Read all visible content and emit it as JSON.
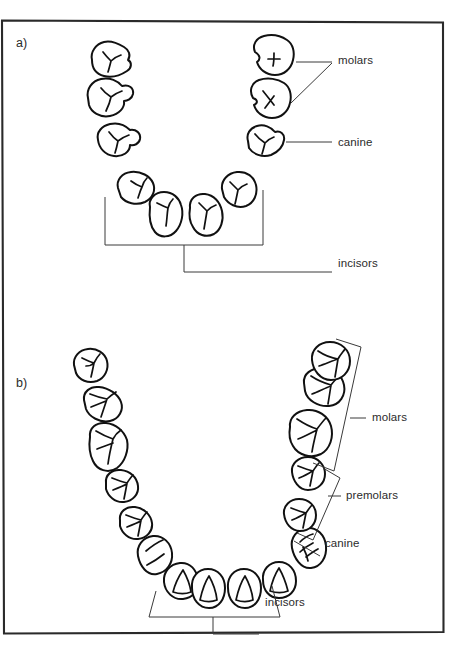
{
  "figure": {
    "background_color": "#ffffff",
    "ink_color": "#111111",
    "leader_color": "#3a3a3a",
    "frame": {
      "x": 2,
      "y": 20,
      "width": 441,
      "height": 613
    }
  },
  "panels": [
    {
      "id": "a",
      "tag": "a)",
      "description": "Upper diagram: dental arch with molars, canine and incisors labelled",
      "tooth_count": 10,
      "labels": [
        {
          "key": "molars",
          "text": "molars",
          "x": 338,
          "y": 54
        },
        {
          "key": "canine",
          "text": "canine",
          "x": 338,
          "y": 136
        },
        {
          "key": "incisors",
          "text": "incisors",
          "x": 338,
          "y": 257
        }
      ],
      "teeth_groups": [
        {
          "name": "molars",
          "side": "left",
          "count": 2
        },
        {
          "name": "molars",
          "side": "right",
          "count": 2
        },
        {
          "name": "canine",
          "side": "left",
          "count": 1
        },
        {
          "name": "canine",
          "side": "right",
          "count": 1
        },
        {
          "name": "incisors",
          "side": "both",
          "count": 4
        }
      ]
    },
    {
      "id": "b",
      "tag": "b)",
      "description": "Lower diagram: dental arch with molars, premolars, canine and incisors labelled",
      "tooth_count": 16,
      "labels": [
        {
          "key": "molars",
          "text": "molars",
          "x": 372,
          "y": 411
        },
        {
          "key": "premolars",
          "text": "premolars",
          "x": 346,
          "y": 492
        },
        {
          "key": "canine",
          "text": "canine",
          "x": 325,
          "y": 539
        },
        {
          "key": "incisors",
          "text": "incisors",
          "x": 265,
          "y": 597
        }
      ],
      "teeth_groups": [
        {
          "name": "molars",
          "side": "left",
          "count": 3
        },
        {
          "name": "molars",
          "side": "right",
          "count": 3
        },
        {
          "name": "premolars",
          "side": "left",
          "count": 2
        },
        {
          "name": "premolars",
          "side": "right",
          "count": 2
        },
        {
          "name": "canine",
          "side": "left",
          "count": 1
        },
        {
          "name": "canine",
          "side": "right",
          "count": 1
        },
        {
          "name": "incisors",
          "side": "both",
          "count": 4
        }
      ]
    }
  ]
}
